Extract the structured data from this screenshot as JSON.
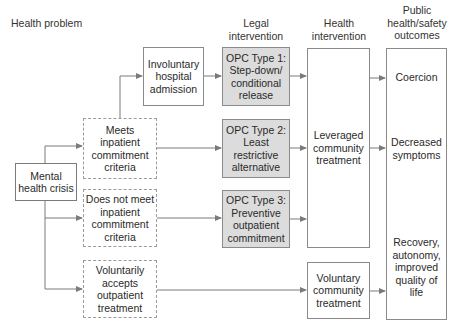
{
  "diagram": {
    "column_headers": {
      "health_problem": "Health problem",
      "legal_intervention": "Legal\nintervention",
      "health_intervention": "Health\nintervention",
      "outcomes": "Public\nhealth/safety\noutcomes"
    },
    "nodes": {
      "mental_health_crisis": "Mental\nhealth crisis",
      "meets_criteria": "Meets\ninpatient\ncommitment\ncriteria",
      "does_not_meet_criteria": "Does not meet\ninpatient\ncommitment\ncriteria",
      "voluntarily_accepts": "Voluntarily\naccepts\noutpatient\ntreatment",
      "involuntary_admission": "Involuntary\nhospital\nadmission",
      "opc_type1": "OPC Type 1:\nStep-down/\nconditional\nrelease",
      "opc_type2": "OPC Type 2:\nLeast\nrestrictive\nalternative",
      "opc_type3": "OPC Type 3:\nPreventive\noutpatient\ncommitment",
      "leveraged_treatment": "Leveraged\ncommunity\ntreatment",
      "voluntary_treatment": "Voluntary\ncommunity\ntreatment"
    },
    "outcomes": {
      "coercion": "Coercion",
      "decreased_symptoms": "Decreased\nsymptoms",
      "recovery": "Recovery,\nautonomy,\nimproved\nquality of\nlife"
    },
    "colors": {
      "line": "#7a7a7a",
      "grey_box": "#dcdcdc",
      "text": "#2a2a2a"
    }
  }
}
